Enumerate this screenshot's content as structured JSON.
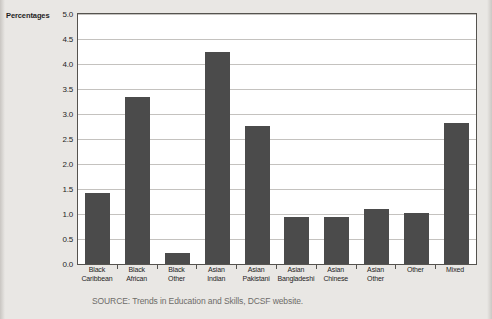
{
  "page": {
    "y_axis_label": "Percentages",
    "title_fragment": "",
    "source_note": "SOURCE: Trends in Education and Skills, DCSF website."
  },
  "colors": {
    "bar": "#4b4b4b",
    "plot_background": "#ffffff",
    "page_background": "#e9e7e4",
    "gridline": "#c4c2bf",
    "axis": "#55534f",
    "text": "#1e1e1e",
    "source_text": "#6e6c69"
  },
  "chart_data": {
    "type": "bar",
    "title": "",
    "xlabel": "",
    "ylabel": "Percentages",
    "ylim": [
      0,
      5.0
    ],
    "ytick_step": 0.5,
    "ytick_labels": [
      "0.0",
      "0.5",
      "1.0",
      "1.5",
      "2.0",
      "2.5",
      "3.0",
      "3.5",
      "4.0",
      "4.5",
      "5.0"
    ],
    "grid": true,
    "legend": false,
    "categories": [
      "Black Caribbean",
      "Black African",
      "Black Other",
      "Asian Indian",
      "Asian Pakistani",
      "Asian Bangladeshi",
      "Asian Chinese",
      "Asian Other",
      "Other",
      "Mixed"
    ],
    "category_lines": [
      [
        "Black",
        "Caribbean"
      ],
      [
        "Black",
        "African"
      ],
      [
        "Black",
        "Other"
      ],
      [
        "Asian",
        "Indian"
      ],
      [
        "Asian",
        "Pakistani"
      ],
      [
        "Asian",
        "Bangladeshi"
      ],
      [
        "Asian",
        "Chinese"
      ],
      [
        "Asian",
        "Other"
      ],
      [
        "Other",
        ""
      ],
      [
        "Mixed",
        ""
      ]
    ],
    "values": [
      1.43,
      3.35,
      0.22,
      4.25,
      2.77,
      0.95,
      0.95,
      1.1,
      1.03,
      2.83
    ],
    "source": "SOURCE: Trends in Education and Skills, DCSF website."
  }
}
